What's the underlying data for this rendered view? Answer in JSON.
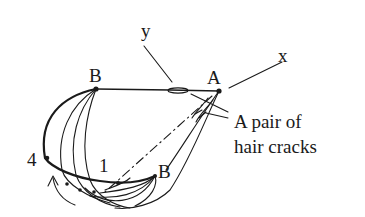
{
  "diagram": {
    "type": "schematic sketch",
    "ink_color": "#1a1a1a",
    "background": "#ffffff",
    "labels": {
      "axis_y": "y",
      "axis_x": "x",
      "point_A": "A",
      "point_B_top": "B",
      "point_B_bottom": "B",
      "point_4": "4",
      "point_1": "1",
      "annotation_line1": "A pair of",
      "annotation_line2": "hair cracks"
    }
  }
}
